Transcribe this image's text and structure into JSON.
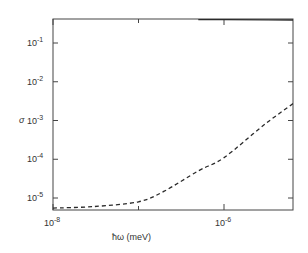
{
  "chart_data": {
    "type": "line",
    "title": "",
    "xlabel": "ħω (meV)",
    "ylabel": "σ",
    "xscale": "log",
    "yscale": "log",
    "xlim": [
      1e-08,
      0.004
    ],
    "ylim": [
      4e-06,
      0.42
    ],
    "grid": false,
    "legend": null,
    "x_ticks": [
      {
        "base": "10",
        "exp": "-8",
        "value": 1e-08
      },
      {
        "base": "10",
        "exp": "-6",
        "value": 1e-06
      },
      {
        "base": "10",
        "exp": "-4",
        "value": 0.0001
      }
    ],
    "y_ticks": [
      {
        "base": "10",
        "exp": "-1",
        "value": 0.1
      },
      {
        "base": "10",
        "exp": "-2",
        "value": 0.01
      },
      {
        "base": "10",
        "exp": "-3",
        "value": 0.001
      },
      {
        "base": "10",
        "exp": "-4",
        "value": 0.0001
      },
      {
        "base": "10",
        "exp": "-5",
        "value": 1e-05
      }
    ],
    "series": [
      {
        "name": "solid",
        "style": "solid",
        "x": [
          5e-07,
          1e-06,
          1e-05,
          3e-05,
          6e-05,
          0.0001,
          0.0002,
          0.0005,
          0.001,
          0.004
        ],
        "y": [
          0.4,
          0.4,
          0.39,
          0.36,
          0.3,
          0.22,
          0.12,
          0.045,
          0.022,
          0.007
        ]
      },
      {
        "name": "dashed",
        "style": "dashed",
        "x": [
          1e-08,
          3e-08,
          1e-07,
          2e-07,
          5e-07,
          1e-06,
          3e-06,
          1e-05,
          2e-05,
          4e-05,
          6e-05,
          0.0001,
          0.0003,
          0.001,
          0.004
        ],
        "y": [
          5.5e-06,
          6e-06,
          8e-06,
          1.5e-05,
          5e-05,
          0.00011,
          0.0008,
          0.006,
          0.04,
          0.11,
          0.13,
          0.1,
          0.035,
          0.011,
          0.0025
        ]
      }
    ]
  },
  "labels": {
    "ylabel": "σ",
    "xlabel": "ħω (meV)"
  }
}
